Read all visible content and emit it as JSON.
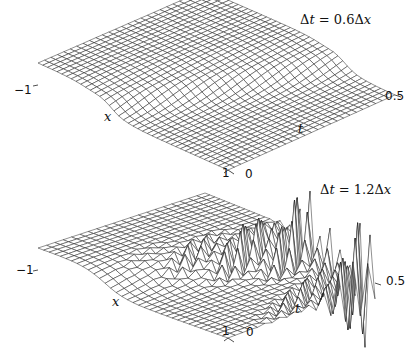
{
  "chart_data": [
    {
      "type": "surface",
      "title": "Δt = 0.6Δx",
      "annotation": "Δt = 0.6Δx",
      "xlabel": "x",
      "ylabel": "t",
      "x_ticks": [
        "-1",
        "1"
      ],
      "t_ticks": [
        "0",
        "0.5"
      ],
      "xlim": [
        -1,
        1
      ],
      "tlim": [
        0,
        0.5
      ],
      "grid": "wireframe mesh",
      "description": "Smooth traveling step/pulse; stable solution",
      "corners": {
        "left": [
          38,
          85
        ],
        "front": [
          228,
          170
        ],
        "right": [
          395,
          95
        ],
        "back": [
          205,
          12
        ]
      },
      "amplitude": 22,
      "instability": 0,
      "nx": 40,
      "nt": 26
    },
    {
      "type": "surface",
      "title": "Δt = 1.2Δx",
      "annotation": "Δt = 1.2Δx",
      "xlabel": "x",
      "ylabel": "t",
      "x_ticks": [
        "-1",
        "1"
      ],
      "t_ticks": [
        "0",
        "0.5"
      ],
      "xlim": [
        -1,
        1
      ],
      "tlim": [
        0,
        0.5
      ],
      "grid": "wireframe mesh",
      "description": "Step with growing oscillations; unstable solution",
      "corners": {
        "left": [
          38,
          90
        ],
        "front": [
          228,
          158
        ],
        "right": [
          375,
          103
        ],
        "back": [
          205,
          35
        ]
      },
      "amplitude": 22,
      "instability": 1,
      "nx": 34,
      "nt": 20
    }
  ],
  "panels": {
    "top": {
      "equation": {
        "delta1": "Δ",
        "var1": "t",
        "eq": " = 0.6",
        "delta2": "Δ",
        "var2": "x"
      },
      "tick_left": "−1",
      "tick_front_x": "1",
      "tick_front_t": "0",
      "tick_right": "0.5",
      "xlabel": "x",
      "tlabel": "t"
    },
    "bottom": {
      "equation": {
        "delta1": "Δ",
        "var1": "t",
        "eq": " = 1.2",
        "delta2": "Δ",
        "var2": "x"
      },
      "tick_left": "−1",
      "tick_front_x": "1",
      "tick_front_t": "0",
      "tick_right": "0.5",
      "xlabel": "x",
      "tlabel": "t"
    }
  },
  "colors": {
    "line": "#222222",
    "face": "#ffffff",
    "background": "#ffffff"
  }
}
